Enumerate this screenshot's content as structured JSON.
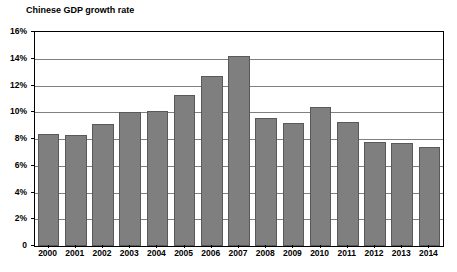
{
  "chart_data": {
    "type": "bar",
    "title": "Chinese GDP growth rate",
    "xlabel": "",
    "ylabel": "",
    "categories": [
      "2000",
      "2001",
      "2002",
      "2003",
      "2004",
      "2005",
      "2006",
      "2007",
      "2008",
      "2009",
      "2010",
      "2011",
      "2012",
      "2013",
      "2014"
    ],
    "values": [
      8.4,
      8.3,
      9.1,
      10.0,
      10.1,
      11.3,
      12.7,
      14.2,
      9.6,
      9.2,
      10.4,
      9.3,
      7.8,
      7.7,
      7.4
    ],
    "ylim": [
      0,
      16
    ],
    "y_ticks": [
      0,
      2,
      4,
      6,
      8,
      10,
      12,
      14,
      16
    ],
    "y_tick_labels": [
      "0",
      "2%",
      "4%",
      "6%",
      "8%",
      "10%",
      "12%",
      "14%",
      "16%"
    ],
    "grid": true,
    "legend": null,
    "legend_position": "none",
    "bar_color": "#7f7f7f",
    "bar_border_color": "#595959",
    "gridline_color": "#808080",
    "axis_color": "#000000",
    "background_color": "#ffffff",
    "series": [
      {
        "name": "Chinese GDP growth rate",
        "values": [
          8.4,
          8.3,
          9.1,
          10.0,
          10.1,
          11.3,
          12.7,
          14.2,
          9.6,
          9.2,
          10.4,
          9.3,
          7.8,
          7.7,
          7.4
        ]
      }
    ]
  }
}
